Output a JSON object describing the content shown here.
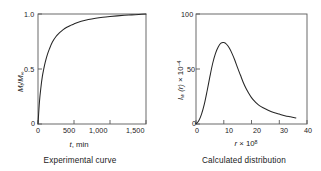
{
  "figure": {
    "background_color": "#ffffff",
    "curve_color": "#262626",
    "axis_color": "#4d4d4d"
  },
  "chart_data": [
    {
      "type": "line",
      "panel": "left",
      "title": "",
      "caption": "Experimental curve",
      "xlabel": "t, min",
      "ylabel": "Mt/M∞",
      "ylabel_parts": {
        "base1": "M",
        "sub1": "t",
        "slash": "/",
        "base2": "M",
        "sub2": "∞"
      },
      "xlabel_parts": {
        "symbol": "t",
        "unit": ", min"
      },
      "xlim": [
        0,
        1500
      ],
      "ylim": [
        0,
        1.0
      ],
      "xticks": [
        0,
        500,
        1000,
        1500
      ],
      "xtick_labels": [
        "0",
        "500",
        "1,000",
        "1,500"
      ],
      "yticks": [
        0,
        0.5,
        1.0
      ],
      "ytick_labels": [
        "0",
        "0.5",
        "1.0"
      ],
      "grid": false,
      "legend": null,
      "x": [
        0,
        20,
        40,
        60,
        80,
        100,
        130,
        160,
        200,
        250,
        300,
        350,
        400,
        450,
        500,
        600,
        700,
        800,
        900,
        1000,
        1100,
        1200,
        1300,
        1400,
        1500
      ],
      "y": [
        0.0,
        0.2,
        0.33,
        0.43,
        0.5,
        0.56,
        0.63,
        0.685,
        0.745,
        0.795,
        0.83,
        0.858,
        0.879,
        0.896,
        0.91,
        0.933,
        0.949,
        0.961,
        0.97,
        0.977,
        0.983,
        0.988,
        0.992,
        0.996,
        1.0
      ]
    },
    {
      "type": "line",
      "panel": "right",
      "title": "",
      "caption": "Calculated distribution",
      "xlabel": "r × 10⁸",
      "ylabel": "Iw (r) × 10⁻⁴",
      "ylabel_parts": {
        "base": "I",
        "sub": "w",
        "paren": " (r) ",
        "times": "× 10",
        "sup": "−4"
      },
      "xlabel_parts": {
        "symbol": "r",
        "times": " × 10",
        "sup": "8"
      },
      "xlim": [
        0,
        40
      ],
      "ylim": [
        0,
        100
      ],
      "xticks": [
        0,
        10,
        20,
        30,
        40
      ],
      "xtick_labels": [
        "0",
        "10",
        "20",
        "30",
        "40"
      ],
      "yticks": [
        0,
        50,
        100
      ],
      "ytick_labels": [
        "0",
        "50",
        "100"
      ],
      "grid": false,
      "legend": null,
      "x": [
        0,
        1,
        2,
        3,
        4,
        5,
        6,
        7,
        8,
        9,
        10,
        11,
        12,
        13,
        14,
        15,
        16,
        17,
        18,
        19,
        20,
        21,
        22,
        23,
        24,
        26,
        28,
        30,
        32,
        34,
        36
      ],
      "y": [
        0,
        3,
        9,
        18,
        30,
        43,
        55,
        64,
        70,
        73.5,
        74,
        72.5,
        69,
        64,
        58,
        51,
        44.5,
        38,
        32.5,
        28,
        24,
        21,
        18.5,
        16.5,
        15,
        12.5,
        10.5,
        9,
        7.6,
        6.5,
        5.5
      ]
    }
  ]
}
